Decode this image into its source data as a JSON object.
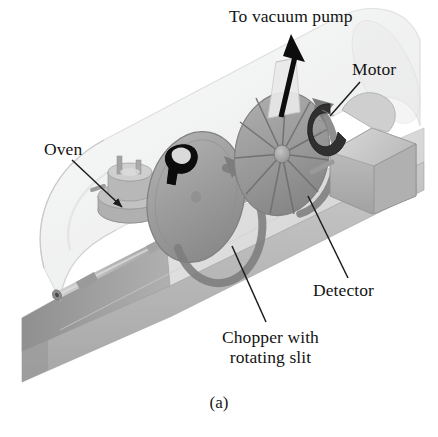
{
  "figure": {
    "caption": "(a)",
    "background_color": "#ffffff"
  },
  "labels": {
    "vacuum_pump": "To vacuum pump",
    "motor": "Motor",
    "oven": "Oven",
    "detector": "Detector",
    "chopper_line1": "Chopper with",
    "chopper_line2": "rotating slit"
  },
  "colors": {
    "ink": "#131313",
    "base_top": "#e3e3e3",
    "base_front": "#b9b9b9",
    "base_side": "#9c9c9c",
    "glass": "#f0f0f0",
    "glass_edge": "#d2d2d2",
    "disk_gray": "#9d9d9d",
    "disk_dark": "#858585",
    "disk_light": "#c0c0c0",
    "metal": "#b4b4b4",
    "metal_dark": "#8f8f8f",
    "motor_box": "#c6c6c6",
    "coil_dark": "#2e2e2e",
    "arrow_black": "#0d0d0d"
  },
  "parts": [
    {
      "name": "vacuum-chamber",
      "label": "glass vacuum chamber"
    },
    {
      "name": "base-slab",
      "label": "support base"
    },
    {
      "name": "oven",
      "label": "Oven"
    },
    {
      "name": "collimator-tube",
      "label": "collimating tube"
    },
    {
      "name": "chopper-disk",
      "label": "Chopper with rotating slit"
    },
    {
      "name": "detector-wheel",
      "label": "Detector"
    },
    {
      "name": "motor",
      "label": "Motor"
    },
    {
      "name": "vacuum-port",
      "label": "To vacuum pump"
    }
  ]
}
